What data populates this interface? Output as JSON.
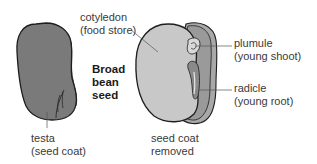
{
  "title": {
    "line1": "Broad",
    "line2": "bean",
    "line3": "seed"
  },
  "labels": {
    "cotyledon": {
      "name": "cotyledon",
      "desc": "(food store)"
    },
    "plumule": {
      "name": "plumule",
      "desc": "(young shoot)"
    },
    "radicle": {
      "name": "radicle",
      "desc": "(young root)"
    },
    "testa": {
      "name": "testa",
      "desc": "(seed coat)"
    },
    "seed_coat_removed": {
      "line1": "seed coat",
      "line2": "removed"
    }
  },
  "colors": {
    "testa_fill": "#7a7a7a",
    "cotyledon_fill": "#c8c8c8",
    "embryo_fill": "#9a9a9a",
    "outline": "#1e1e1e",
    "leader_line": "#555555"
  }
}
